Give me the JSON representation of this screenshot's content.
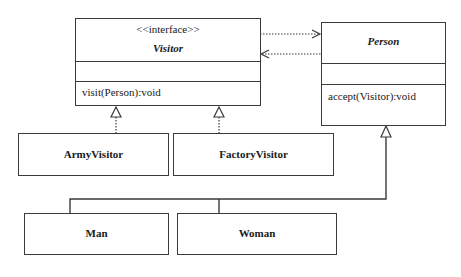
{
  "diagram": {
    "type": "UML class diagram",
    "pattern": "Visitor",
    "classes": {
      "visitor": {
        "stereotype": "<<interface>>",
        "name": "Visitor",
        "method": "visit(Person):void"
      },
      "person": {
        "name": "Person",
        "method": "accept(Visitor):void"
      },
      "army_visitor": {
        "name": "ArmyVisitor"
      },
      "factory_visitor": {
        "name": "FactoryVisitor"
      },
      "man": {
        "name": "Man"
      },
      "woman": {
        "name": "Woman"
      }
    },
    "relationships": [
      {
        "from": "Visitor",
        "to": "Person",
        "kind": "dependency"
      },
      {
        "from": "Person",
        "to": "Visitor",
        "kind": "dependency"
      },
      {
        "from": "ArmyVisitor",
        "to": "Visitor",
        "kind": "realization"
      },
      {
        "from": "FactoryVisitor",
        "to": "Visitor",
        "kind": "realization"
      },
      {
        "from": "Man",
        "to": "Person",
        "kind": "generalization"
      },
      {
        "from": "Woman",
        "to": "Person",
        "kind": "generalization"
      }
    ],
    "colors": {
      "line": "#3a3a3a",
      "background": "#ffffff"
    }
  }
}
